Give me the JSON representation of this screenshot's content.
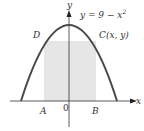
{
  "diagram": {
    "equation": "y = 9 − x",
    "equation_exponent": "2",
    "axis_x_label": "x",
    "axis_y_label": "y",
    "origin_label": "0",
    "points": {
      "A": "A",
      "B": "B",
      "C": "C(x, y)",
      "D": "D"
    },
    "colors": {
      "curve": "#4a4a4a",
      "rectangle_fill": "#e6e6e6",
      "axes": "#333333"
    }
  }
}
